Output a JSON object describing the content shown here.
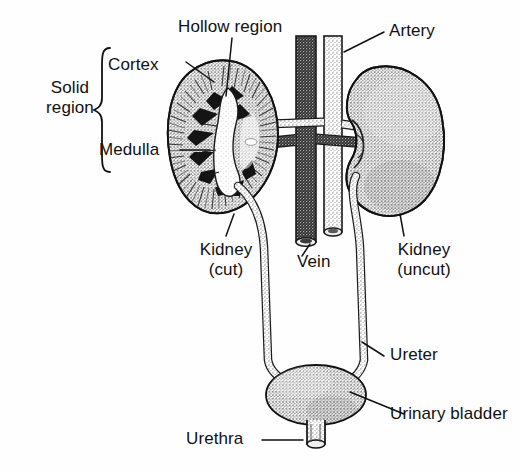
{
  "figure": {
    "background_color": "#fefefe",
    "ink_color": "#111111",
    "stipple_color": "#6f6f6f"
  },
  "labels": {
    "solid_region": {
      "line1": "Solid",
      "line2": "region"
    },
    "cortex": "Cortex",
    "medulla": "Medulla",
    "hollow_region": "Hollow region",
    "artery": "Artery",
    "vein": "Vein",
    "kidney_cut": {
      "line1": "Kidney",
      "line2": "(cut)"
    },
    "kidney_uncut": {
      "line1": "Kidney",
      "line2": "(uncut)"
    },
    "ureter": "Ureter",
    "urinary_bladder": "Urinary bladder",
    "urethra": "Urethra"
  },
  "structures": [
    {
      "name": "kidney-cut",
      "description": "left kidney shown in longitudinal section"
    },
    {
      "name": "kidney-uncut",
      "description": "right kidney shown whole"
    },
    {
      "name": "renal-cortex",
      "description": "outer stippled band of sectioned kidney"
    },
    {
      "name": "renal-medulla",
      "description": "dark inner pyramids of sectioned kidney"
    },
    {
      "name": "renal-pelvis",
      "description": "hollow region at kidney hilum"
    },
    {
      "name": "vein",
      "description": "dark vertical inferior vena cava with cut lower end"
    },
    {
      "name": "artery",
      "description": "lighter vertical aorta with cut lower end"
    },
    {
      "name": "renal-vessels",
      "description": "horizontal branches joining vessels to kidneys"
    },
    {
      "name": "ureter-left",
      "description": "tube from left kidney to bladder"
    },
    {
      "name": "ureter-right",
      "description": "tube from right kidney to bladder"
    },
    {
      "name": "urinary-bladder",
      "description": "stippled oval sac"
    },
    {
      "name": "urethra",
      "description": "short tube at base of bladder"
    }
  ]
}
